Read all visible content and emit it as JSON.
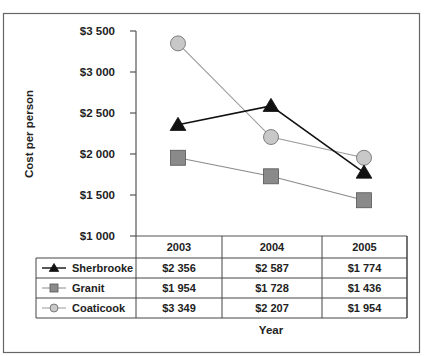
{
  "chart_data": {
    "type": "line",
    "title": "",
    "xlabel": "Year",
    "ylabel": "Cost per person",
    "categories": [
      "2003",
      "2004",
      "2005"
    ],
    "ylim": [
      1000,
      3500
    ],
    "yticks": [
      1000,
      1500,
      2000,
      2500,
      3000,
      3500
    ],
    "ytick_labels": [
      "$1 000",
      "$1 500",
      "$2 000",
      "$2 500",
      "$3 000",
      "$3 500"
    ],
    "grid": false,
    "legend_placement": "data-table-below",
    "series": [
      {
        "name": "Sherbrooke",
        "marker": "triangle",
        "color": "#111111",
        "line_color": "#111111",
        "values": [
          2356,
          2587,
          1774
        ],
        "labels": [
          "$2 356",
          "$2 587",
          "$1 774"
        ]
      },
      {
        "name": "Granit",
        "marker": "square",
        "color": "#8a8a8a",
        "line_color": "#8a8a8a",
        "values": [
          1954,
          1728,
          1436
        ],
        "labels": [
          "$1 954",
          "$1 728",
          "$1 436"
        ]
      },
      {
        "name": "Coaticook",
        "marker": "circle",
        "color": "#c8c8c8",
        "line_color": "#9a9a9a",
        "values": [
          3349,
          2207,
          1954
        ],
        "labels": [
          "$3 349",
          "$2 207",
          "$1 954"
        ]
      }
    ]
  }
}
